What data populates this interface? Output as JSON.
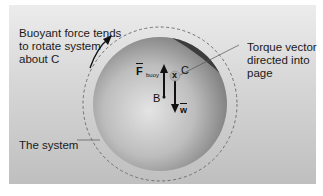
{
  "figure": {
    "labels": {
      "buoyant_note": "Buoyant force tends to rotate system about C",
      "torque_note": "Torque vector directed into page",
      "system_note": "The system"
    },
    "symbols": {
      "center_of_mass": "C",
      "center_of_buoyancy": "B",
      "torque_into_page": "x",
      "buoyant_force": "F",
      "buoyant_force_subscript": "buoy",
      "weight": "w"
    },
    "colors": {
      "background_panel_top": "#ececec",
      "background_panel_bottom": "#bfbfbf",
      "ball_light": "#dcdcdc",
      "ball_dark": "#7a7a7a",
      "dense_cap": "#3a3a3a",
      "arrows": "#111111"
    }
  }
}
